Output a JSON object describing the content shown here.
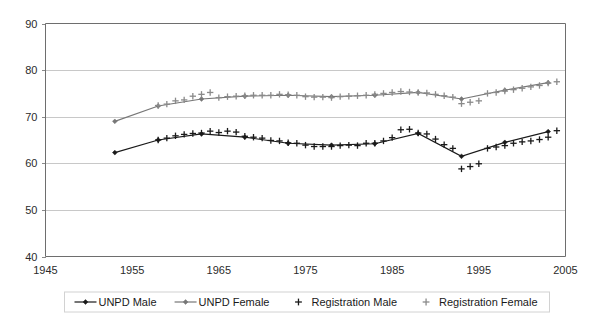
{
  "chart_data": {
    "type": "line",
    "title": "",
    "subtitle": "",
    "xlabel": "",
    "ylabel": "",
    "xlim": [
      1945,
      2005
    ],
    "ylim": [
      40,
      90
    ],
    "x_ticks": [
      1945,
      1955,
      1965,
      1975,
      1985,
      1995,
      2005
    ],
    "y_ticks": [
      40,
      50,
      60,
      70,
      80,
      90
    ],
    "grid": "horizontal",
    "legend_position": "bottom",
    "series": [
      {
        "name": "UNPD Male",
        "style": "line-marker",
        "color": "#1a1a1a",
        "marker": "diamond",
        "x": [
          1953,
          1958,
          1963,
          1968,
          1973,
          1978,
          1983,
          1988,
          1993,
          1998,
          2003
        ],
        "values": [
          62.3,
          65.0,
          66.3,
          65.6,
          64.3,
          63.9,
          64.2,
          66.4,
          61.5,
          64.5,
          66.8
        ]
      },
      {
        "name": "UNPD Female",
        "style": "line-marker",
        "color": "#777777",
        "marker": "diamond",
        "x": [
          1953,
          1958,
          1963,
          1968,
          1973,
          1978,
          1983,
          1988,
          1993,
          1998,
          2003
        ],
        "values": [
          69.0,
          72.3,
          73.8,
          74.4,
          74.6,
          74.3,
          74.6,
          75.2,
          73.8,
          75.7,
          77.3
        ]
      },
      {
        "name": "Registration Male",
        "style": "marker-only",
        "color": "#1a1a1a",
        "marker": "plus",
        "x": [
          1958,
          1959,
          1960,
          1961,
          1962,
          1963,
          1964,
          1965,
          1966,
          1967,
          1968,
          1969,
          1970,
          1971,
          1972,
          1973,
          1974,
          1975,
          1976,
          1977,
          1978,
          1979,
          1980,
          1981,
          1982,
          1983,
          1984,
          1985,
          1986,
          1987,
          1988,
          1989,
          1990,
          1991,
          1992,
          1993,
          1994,
          1995,
          1996,
          1997,
          1998,
          1999,
          2000,
          2001,
          2002,
          2003,
          2004
        ],
        "values": [
          65.0,
          65.4,
          65.9,
          66.2,
          66.4,
          66.5,
          66.9,
          66.6,
          66.9,
          66.7,
          65.8,
          65.6,
          65.4,
          64.9,
          64.8,
          64.4,
          64.3,
          63.9,
          63.6,
          63.6,
          63.6,
          63.8,
          63.9,
          63.8,
          64.3,
          64.3,
          64.8,
          65.5,
          67.2,
          67.3,
          66.5,
          66.3,
          65.2,
          64.0,
          63.2,
          58.8,
          59.3,
          59.9,
          63.2,
          63.5,
          63.8,
          64.3,
          64.6,
          64.8,
          65.1,
          65.6,
          67.0
        ]
      },
      {
        "name": "Registration Female",
        "style": "marker-only",
        "color": "#8a8a8a",
        "marker": "plus",
        "x": [
          1958,
          1959,
          1960,
          1961,
          1962,
          1963,
          1964,
          1965,
          1966,
          1967,
          1968,
          1969,
          1970,
          1971,
          1972,
          1973,
          1974,
          1975,
          1976,
          1977,
          1978,
          1979,
          1980,
          1981,
          1982,
          1983,
          1984,
          1985,
          1986,
          1987,
          1988,
          1989,
          1990,
          1991,
          1992,
          1993,
          1994,
          1995,
          1996,
          1997,
          1998,
          1999,
          2000,
          2001,
          2002,
          2003,
          2004
        ],
        "values": [
          72.4,
          72.7,
          73.4,
          73.6,
          74.4,
          74.8,
          75.2,
          74.1,
          74.3,
          74.4,
          74.5,
          74.6,
          74.6,
          74.6,
          74.8,
          74.7,
          74.6,
          74.3,
          74.2,
          74.2,
          74.1,
          74.3,
          74.4,
          74.5,
          74.6,
          74.8,
          75.0,
          75.2,
          75.4,
          75.3,
          75.2,
          75.1,
          74.8,
          74.5,
          74.2,
          72.8,
          73.1,
          73.4,
          75.0,
          75.2,
          75.5,
          75.8,
          76.1,
          76.4,
          76.7,
          77.2,
          77.5
        ]
      }
    ],
    "legend": [
      {
        "label": "UNPD Male",
        "marker": "line-diamond",
        "color": "#1a1a1a"
      },
      {
        "label": "UNPD Female",
        "marker": "line-diamond",
        "color": "#777777"
      },
      {
        "label": "Registration Male",
        "marker": "plus",
        "color": "#1a1a1a"
      },
      {
        "label": "Registration Female",
        "marker": "plus",
        "color": "#8a8a8a"
      }
    ]
  },
  "axes": {
    "y_tick_labels": [
      "90",
      "80",
      "70",
      "60",
      "50",
      "40"
    ],
    "x_tick_labels": [
      "1945",
      "1955",
      "1965",
      "1975",
      "1985",
      "1995",
      "2005"
    ]
  }
}
